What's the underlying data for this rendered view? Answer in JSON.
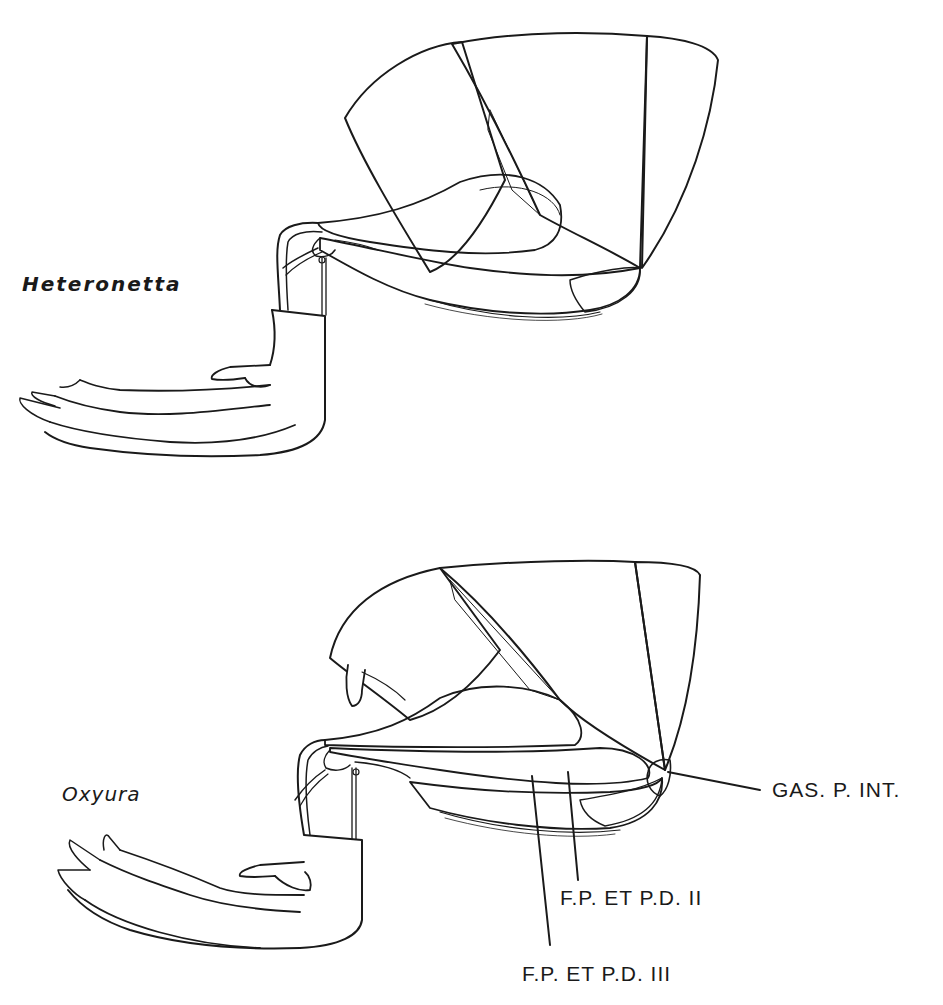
{
  "figure": {
    "panels": [
      {
        "id": "top",
        "taxon": "Heteronetta"
      },
      {
        "id": "bottom",
        "taxon": "Oxyura",
        "annotations": [
          {
            "label": "GAS. P. INT."
          },
          {
            "label": "F.P. ET P.D. II"
          },
          {
            "label": "F.P. ET P.D. III"
          }
        ]
      }
    ],
    "colors": {
      "ink": "#1a1a1a",
      "background": "#ffffff"
    }
  }
}
